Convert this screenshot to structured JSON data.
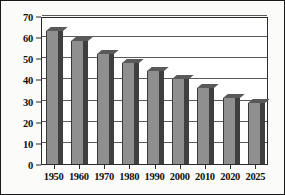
{
  "chart_data": {
    "type": "bar",
    "title": "",
    "subtitle": "",
    "xlabel": "",
    "ylabel": "",
    "categories": [
      "1950",
      "1960",
      "1970",
      "1980",
      "1990",
      "2000",
      "2010",
      "2020",
      "2025"
    ],
    "values": [
      63,
      58,
      52,
      48,
      44,
      40,
      36,
      31,
      29
    ],
    "ylim": [
      0,
      70
    ],
    "y_ticks": [
      "0",
      "10",
      "20",
      "30",
      "40",
      "50",
      "60",
      "70"
    ],
    "y_tick_values": [
      0,
      10,
      20,
      30,
      40,
      50,
      60,
      70
    ],
    "grid": true,
    "legend": "none",
    "series": [
      {
        "name": "",
        "values": [
          63,
          58,
          52,
          48,
          44,
          40,
          36,
          31,
          29
        ]
      }
    ],
    "style": {
      "bar_face_color": "#8f8f8f",
      "bar_side_color": "#3f3f3f",
      "bar_top_color": "#595959",
      "gridline_color": "#5a5a5a",
      "axis_color": "#2b2b2b",
      "text_color": "#111111",
      "plot_background": "#ffffff",
      "frame_background": "#fbfbfa",
      "frame_border_color": "#1a1a1a",
      "three_d": true
    }
  }
}
